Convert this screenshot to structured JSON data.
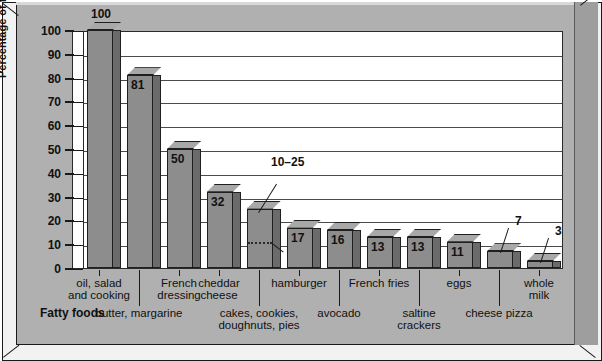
{
  "chart_data": {
    "type": "bar",
    "title": "",
    "xlabel": "Fatty foods",
    "ylabel": "Percentage of fat by weight",
    "ylim": [
      0,
      100
    ],
    "ytick_labels": [
      "0",
      "10",
      "20",
      "30",
      "40",
      "50",
      "60",
      "70",
      "80",
      "90",
      "100"
    ],
    "ytick_values": [
      0,
      10,
      20,
      30,
      40,
      50,
      60,
      70,
      80,
      90,
      100
    ],
    "grid": true,
    "legend": "none",
    "categories": [
      "oil, salad\nand cooking",
      "butter, margarine",
      "French\ndressing",
      "cheddar\ncheese",
      "cakes, cookies,\ndoughnuts, pies",
      "hamburger",
      "avocado",
      "French fries",
      "saltine\ncrackers",
      "eggs",
      "cheese pizza",
      "whole\nmilk"
    ],
    "values": [
      100,
      81,
      50,
      32,
      25,
      17,
      16,
      13,
      13,
      11,
      7,
      3
    ],
    "value_labels": [
      "100",
      "81",
      "50",
      "32",
      "10–25",
      "17",
      "16",
      "13",
      "13",
      "11",
      "7",
      "3"
    ],
    "range_bar": {
      "category": "cakes, cookies,\ndoughnuts, pies",
      "low": 10,
      "high": 25,
      "label": "10–25"
    },
    "label_rows": [
      0,
      1,
      0,
      0,
      1,
      0,
      1,
      0,
      1,
      0,
      1,
      0
    ]
  },
  "colors": {
    "background": "#b0b0b0",
    "plot_background": "#ffffff",
    "bar_front": "#8d8d8d",
    "bar_side": "#6b6b6b",
    "bar_top": "#a8a8a8",
    "gridline": "#4a4a4a",
    "text": "#111111",
    "frame_edge": "#1a1a1a"
  }
}
